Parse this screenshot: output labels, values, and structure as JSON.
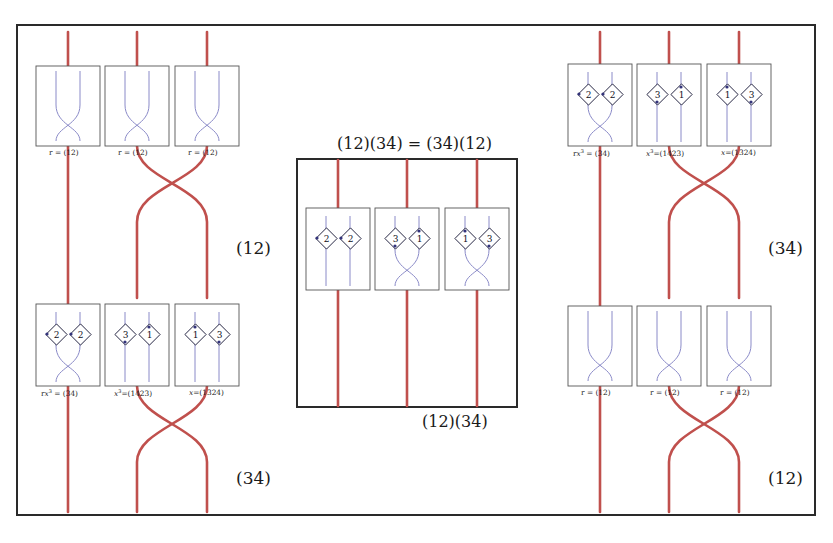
{
  "figure": {
    "center_panel": {
      "title": "(12)(34) = (34)(12)",
      "caption": "(12)(34)",
      "boxes": [
        {
          "kind": "identity",
          "diamonds": [
            "2",
            "2"
          ]
        },
        {
          "kind": "crossing",
          "diamonds": [
            "3",
            "1"
          ]
        },
        {
          "kind": "crossing",
          "diamonds": [
            "1",
            "3"
          ]
        }
      ]
    },
    "left_panel": {
      "annotation_upper": "(12)",
      "annotation_lower": "(34)",
      "top_row": {
        "boxes": [
          {
            "kind": "crossing",
            "label": "r = (12)"
          },
          {
            "kind": "crossing",
            "label": "r = (12)"
          },
          {
            "kind": "crossing",
            "label": "r = (12)"
          }
        ]
      },
      "bottom_row": {
        "boxes": [
          {
            "kind": "crossing",
            "diamonds": [
              "2",
              "2"
            ],
            "label_html": "r<i>x</i><sup>3</sup> = (34)"
          },
          {
            "kind": "identity",
            "diamonds": [
              "3",
              "1"
            ],
            "label_html": "<i>x</i><sup>3</sup>=(1423)"
          },
          {
            "kind": "identity",
            "diamonds": [
              "1",
              "3"
            ],
            "label_html": "<i>x</i>=(1324)"
          }
        ]
      }
    },
    "right_panel": {
      "annotation_upper": "(34)",
      "annotation_lower": "(12)",
      "top_row": {
        "boxes": [
          {
            "kind": "crossing",
            "diamonds": [
              "2",
              "2"
            ],
            "label_html": "r<i>x</i><sup>3</sup> = (34)"
          },
          {
            "kind": "identity",
            "diamonds": [
              "3",
              "1"
            ],
            "label_html": "<i>x</i><sup>3</sup>=(1423)"
          },
          {
            "kind": "identity",
            "diamonds": [
              "1",
              "3"
            ],
            "label_html": "<i>x</i>=(1324)"
          }
        ]
      },
      "bottom_row": {
        "boxes": [
          {
            "kind": "crossing",
            "label": "r = (12)"
          },
          {
            "kind": "crossing",
            "label": "r = (12)"
          },
          {
            "kind": "crossing",
            "label": "r = (12)"
          }
        ]
      }
    },
    "colors": {
      "strand": "#c0504d",
      "tangle_strand": "#8a8ac8",
      "box_border": "#555555",
      "frame": "#2a2a2a",
      "diamond": "#1b1b3a"
    }
  }
}
